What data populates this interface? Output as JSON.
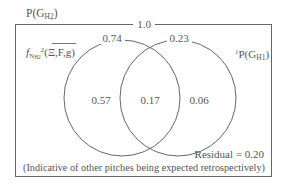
{
  "diagram": {
    "type": "venn",
    "outer_label": "P(G",
    "outer_label_sub": "H2",
    "outer_label_close": ")",
    "total_label": "1.0",
    "left_set": {
      "name_prefix": "f",
      "name_sub": "N",
      "name_sub2": "H2",
      "name_sup": "2",
      "name_arg": "(Ξ,F,g)",
      "top_label": "0.74",
      "only_value": "0.57"
    },
    "right_set": {
      "name_sup": "1",
      "name_prefix": "P(G",
      "name_sub": "H1",
      "name_close": ")",
      "top_label": "0.23",
      "only_value": "0.06"
    },
    "intersection_value": "0.17",
    "residual_label": "Residual = 0.20",
    "residual_note": "(Indicative of other pitches being expected retrospectively)"
  },
  "colors": {
    "line": "#555555",
    "text": "#555555",
    "background": "#ffffff"
  }
}
